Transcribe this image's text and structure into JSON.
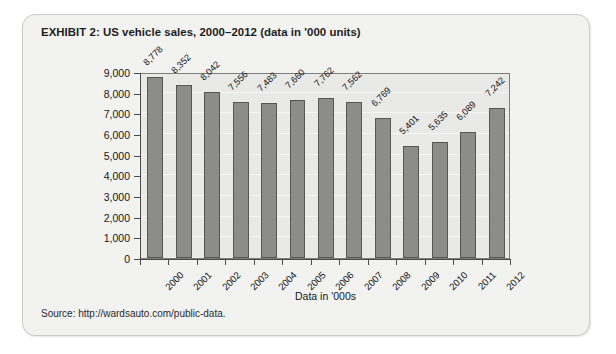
{
  "exhibit": {
    "title": "EXHIBIT 2:  US vehicle sales, 2000–2012 (data in '000 units)",
    "source": "Source: http://wardsauto.com/public-data.",
    "ghost_text": "EXHIBIT 3:  US vehicle sales in thousands"
  },
  "chart_data": {
    "type": "bar",
    "title": "US vehicle sales, 2000–2012 (data in '000 units)",
    "xlabel": "Data in '000s",
    "ylabel": "",
    "categories": [
      "2000",
      "2001",
      "2002",
      "2003",
      "2004",
      "2005",
      "2006",
      "2007",
      "2008",
      "2009",
      "2010",
      "2011",
      "2012"
    ],
    "values": [
      8778,
      8352,
      8042,
      7556,
      7483,
      7660,
      7762,
      7562,
      6769,
      5401,
      5635,
      6089,
      7242
    ],
    "value_labels": [
      "8,778",
      "8,352",
      "8,042",
      "7,556",
      "7,483",
      "7,660",
      "7,762",
      "7,562",
      "6,769",
      "5,401",
      "5,635",
      "6,089",
      "7,242"
    ],
    "ylim": [
      0,
      9000
    ],
    "ytick_values": [
      0,
      1000,
      2000,
      3000,
      4000,
      5000,
      6000,
      7000,
      8000,
      9000
    ],
    "ytick_labels": [
      "0",
      "1,000",
      "2,000",
      "3,000",
      "4,000",
      "5,000",
      "6,000",
      "7,000",
      "8,000",
      "9,000"
    ],
    "grid": true,
    "legend": false,
    "bar_color": "#8c8c8a",
    "bar_border_color": "#565654",
    "plot_background": "#e9e9e7",
    "gridline_color": "#f6f6f5"
  }
}
